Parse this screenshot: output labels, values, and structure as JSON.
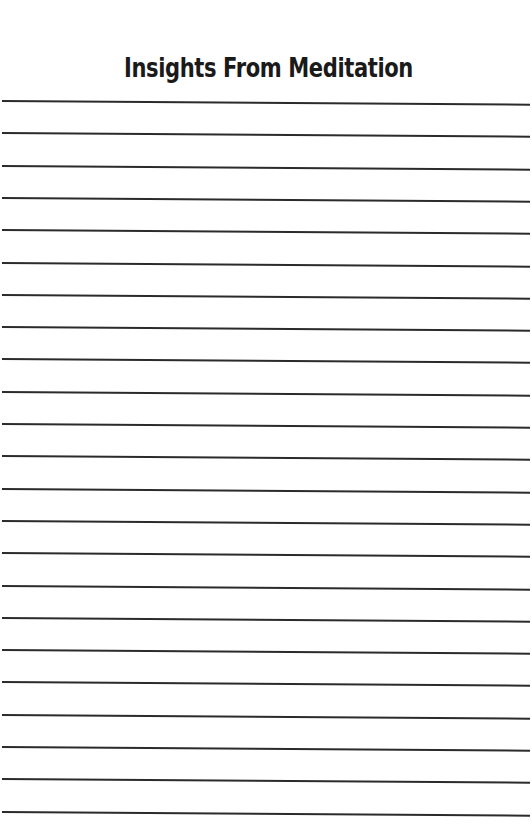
{
  "document": {
    "title": "Insights From Meditation",
    "ruled_lines": {
      "count": 23,
      "first_y": 100,
      "spacing": 32.3,
      "color": "#2b2b2b"
    },
    "background_color": "#ffffff"
  }
}
